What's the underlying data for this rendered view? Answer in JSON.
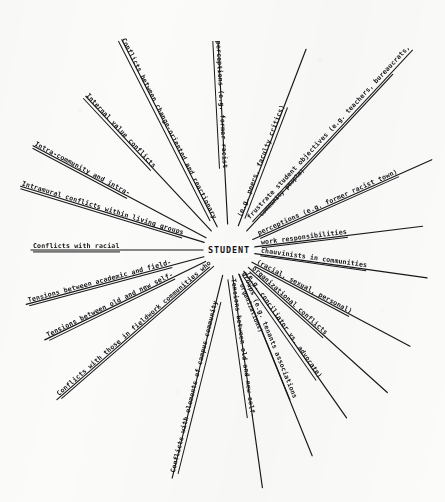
{
  "diagram": {
    "type": "radial-sunburst",
    "title_center": "STUDENT",
    "stroke_color": "#17171a",
    "background_color": "#fbfbf9",
    "center": {
      "x": 229,
      "y": 250
    },
    "spoke_count": 16,
    "spokes": [
      {
        "id": "conflicts-between-change-oriented",
        "label": "Conflicts between change-oriented and reactionary",
        "sublabel": "",
        "angle_deg": -117,
        "length": 236,
        "label_flip": false
      },
      {
        "id": "internal-value-conflicts",
        "label": "Internal value conflicts",
        "sublabel": "",
        "angle_deg": -133,
        "length": 210,
        "label_flip": false
      },
      {
        "id": "intra-community-and-intra",
        "label": "Intra-community and intra-",
        "sublabel": "",
        "angle_deg": -152,
        "length": 222,
        "label_flip": false
      },
      {
        "id": "intramural-conflicts-living-groups",
        "label": "Intramural conflicts within living groups",
        "sublabel": "",
        "angle_deg": -163,
        "length": 218,
        "label_flip": false
      },
      {
        "id": "conflicts-with-racial",
        "label": "Conflicts with racial",
        "sublabel": "",
        "angle_deg": 180,
        "length": 198,
        "label_flip": false
      },
      {
        "id": "tensions-academic-and-field",
        "label": "Tensions between academic and field-",
        "sublabel": "",
        "angle_deg": 165,
        "length": 210,
        "label_flip": false
      },
      {
        "id": "tensions-old-and-new-self-left",
        "label": "Tensions between old and new self-",
        "sublabel": "",
        "angle_deg": 154,
        "length": 205,
        "label_flip": false
      },
      {
        "id": "conflicts-fieldwork-communities",
        "label": "Conflicts with those in fieldwork communities who",
        "sublabel": "",
        "angle_deg": 139,
        "length": 228,
        "label_flip": false
      },
      {
        "id": "conflicts-elements-campus-community",
        "label": "Conflicts with elements of campus community",
        "sublabel": "",
        "angle_deg": 104,
        "length": 235,
        "label_flip": false
      },
      {
        "id": "tensions-old-and-new-self-bottom",
        "label": "Tensions between old and new self-",
        "sublabel": "",
        "angle_deg": 82,
        "length": 240,
        "label_flip": false
      },
      {
        "id": "groups-tenants-associations",
        "label": "groups (e.g. tenants associations",
        "sublabel": "organizations)",
        "angle_deg": 68,
        "length": 222,
        "label_flip": false
      },
      {
        "id": "conciliator-vs-advocate",
        "label": "(e.g. conciliator vs. advocate)",
        "sublabel": "",
        "angle_deg": 55,
        "length": 205,
        "label_flip": false
      },
      {
        "id": "organizational-conflicts",
        "label": "organizational conflicts",
        "sublabel": "",
        "angle_deg": 42,
        "length": 213,
        "label_flip": false
      },
      {
        "id": "racial-sexual-personal",
        "label": "(racial, sexual, personal)",
        "sublabel": "",
        "angle_deg": 28,
        "length": 205,
        "label_flip": false
      },
      {
        "id": "chauvinists-in-communities",
        "label": "chauvinists in communities",
        "sublabel": "",
        "angle_deg": 8,
        "length": 200,
        "label_flip": false
      },
      {
        "id": "work-responsibilities",
        "label": "work responsibilities",
        "sublabel": "",
        "angle_deg": -7,
        "length": 195,
        "label_flip": false
      },
      {
        "id": "perceptions-former-racist-town",
        "label": "perceptions (e.g. former racist town)",
        "sublabel": "",
        "angle_deg": -24,
        "length": 222,
        "label_flip": false
      },
      {
        "id": "frustrate-student-objectives",
        "label": "frustrate student objectives (e.g. teachers, bureaucrats,",
        "sublabel": "community people)",
        "angle_deg": -47,
        "length": 240,
        "label_flip": false
      },
      {
        "id": "peers-faculty-critics",
        "label": "(e.g. peers, faculty critics)",
        "sublabel": "",
        "angle_deg": -69,
        "length": 215,
        "label_flip": false
      },
      {
        "id": "perceptions-former-racist",
        "label": "perceptions (e.g. former racist",
        "sublabel": "",
        "angle_deg": -93,
        "length": 208,
        "label_flip": false
      }
    ]
  }
}
